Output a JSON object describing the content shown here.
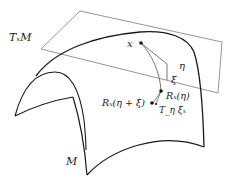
{
  "diagram": {
    "labels": {
      "tangent_space": "TₓM",
      "manifold": "M",
      "point_x": "x",
      "eta": "η",
      "xi": "ξ",
      "retraction_eta": "Rₓ(η)",
      "retraction_eta_xi": "Rₓ(η + ξ)",
      "vector_transport": "T_η ξₓ"
    },
    "colors": {
      "surface_stroke": "#1a1a1a",
      "plane_stroke": "#8a8a8a",
      "curve_stroke": "#555555",
      "point_fill": "#111111",
      "text": "#222222"
    }
  }
}
